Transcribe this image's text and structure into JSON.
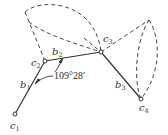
{
  "diagram": {
    "nodes": [
      {
        "id": "c1",
        "label": "c",
        "sub": "1",
        "x": 15,
        "y": 114
      },
      {
        "id": "c2",
        "label": "c",
        "sub": "2",
        "x": 45,
        "y": 61
      },
      {
        "id": "c3",
        "label": "c",
        "sub": "3",
        "x": 101,
        "y": 52
      },
      {
        "id": "c4",
        "label": "c",
        "sub": "4",
        "x": 141,
        "y": 99
      }
    ],
    "bonds": [
      {
        "id": "b1",
        "label": "b",
        "sub": "1",
        "from": "c1",
        "to": "c2"
      },
      {
        "id": "b2",
        "label": "b",
        "sub": "2",
        "from": "c2",
        "to": "c3"
      },
      {
        "id": "b3",
        "label": "b",
        "sub": "3",
        "from": "c3",
        "to": "c4"
      }
    ],
    "angle_label": "109°28′",
    "colors": {
      "line": "#333333",
      "dash": "#444444",
      "background": "#ffffff"
    }
  }
}
